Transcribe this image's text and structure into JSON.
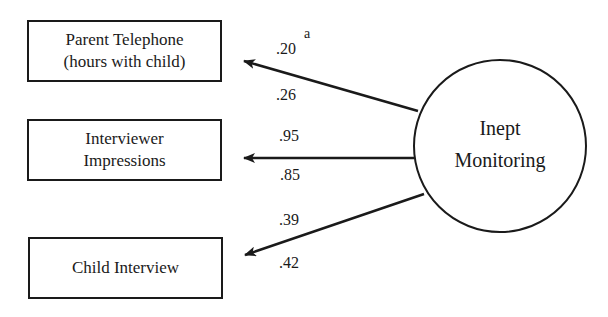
{
  "latent": {
    "line1": "Inept",
    "line2": "Monitoring"
  },
  "indicators": [
    {
      "line1": "Parent Telephone",
      "line2": "(hours with child)",
      "upper": ".20",
      "lower": ".26",
      "superscript": "a"
    },
    {
      "line1": "Interviewer",
      "line2": "Impressions",
      "upper": ".95",
      "lower": ".85"
    },
    {
      "line1": "Child Interview",
      "line2": "",
      "upper": ".39",
      "lower": ".42"
    }
  ]
}
